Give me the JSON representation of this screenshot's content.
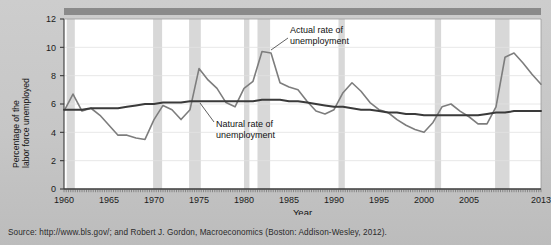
{
  "figure": {
    "source_note": "Source: http://www.bls.gov/; and Robert J. Gordon, Macroeconomics (Boston: Addison-Wesley, 2012)."
  },
  "axes": {
    "ylabel_line1": "Percentage of the",
    "ylabel_line2": "labor force unemployed",
    "xlabel": "Year",
    "yticks": [
      "0",
      "2",
      "4",
      "6",
      "8",
      "10",
      "12"
    ],
    "xticks": [
      "1960",
      "1965",
      "1970",
      "1975",
      "1980",
      "1985",
      "1990",
      "1995",
      "2000",
      "2005",
      "2013"
    ]
  },
  "annotations": [
    {
      "name": "actual-rate-annotation",
      "line1": "Actual rate of",
      "line2": "unemployment"
    },
    {
      "name": "natural-rate-annotation",
      "line1": "Natural rate of",
      "line2": "unemployment"
    }
  ],
  "colors": {
    "actual_line": "#7d7d7d",
    "natural_line": "#3a3a3a",
    "recession_band": "#d8d8d8",
    "plot_background": "#ffffff",
    "page_background": "#c9c9c9",
    "top_bar": "#8a8a8a"
  },
  "chart_data": {
    "type": "line",
    "title": "",
    "xlabel": "Year",
    "ylabel": "Percentage of the labor force unemployed",
    "xlim": [
      1960,
      2013
    ],
    "ylim": [
      0,
      12
    ],
    "grid": true,
    "legend": "inline-annotations",
    "x": [
      1960,
      1961,
      1962,
      1963,
      1964,
      1965,
      1966,
      1967,
      1968,
      1969,
      1970,
      1971,
      1972,
      1973,
      1974,
      1975,
      1976,
      1977,
      1978,
      1979,
      1980,
      1981,
      1982,
      1983,
      1984,
      1985,
      1986,
      1987,
      1988,
      1989,
      1990,
      1991,
      1992,
      1993,
      1994,
      1995,
      1996,
      1997,
      1998,
      1999,
      2000,
      2001,
      2002,
      2003,
      2004,
      2005,
      2006,
      2007,
      2008,
      2009,
      2010,
      2011,
      2012,
      2013
    ],
    "series": [
      {
        "name": "Actual rate of unemployment",
        "color": "#7d7d7d",
        "values": [
          5.5,
          6.7,
          5.5,
          5.7,
          5.2,
          4.5,
          3.8,
          3.8,
          3.6,
          3.5,
          4.9,
          5.9,
          5.6,
          4.9,
          5.6,
          8.5,
          7.7,
          7.1,
          6.1,
          5.8,
          7.1,
          7.6,
          9.7,
          9.6,
          7.5,
          7.2,
          7.0,
          6.2,
          5.5,
          5.3,
          5.6,
          6.8,
          7.5,
          6.9,
          6.1,
          5.6,
          5.4,
          4.9,
          4.5,
          4.2,
          4.0,
          4.7,
          5.8,
          6.0,
          5.5,
          5.1,
          4.6,
          4.6,
          5.8,
          9.3,
          9.6,
          8.9,
          8.1,
          7.4
        ]
      },
      {
        "name": "Natural rate of unemployment",
        "color": "#3a3a3a",
        "values": [
          5.6,
          5.6,
          5.6,
          5.7,
          5.7,
          5.7,
          5.7,
          5.8,
          5.9,
          6.0,
          6.0,
          6.1,
          6.1,
          6.1,
          6.2,
          6.2,
          6.2,
          6.2,
          6.2,
          6.2,
          6.2,
          6.2,
          6.3,
          6.3,
          6.3,
          6.2,
          6.2,
          6.1,
          6.0,
          5.9,
          5.8,
          5.8,
          5.7,
          5.6,
          5.6,
          5.5,
          5.4,
          5.4,
          5.3,
          5.3,
          5.2,
          5.2,
          5.2,
          5.2,
          5.2,
          5.2,
          5.2,
          5.3,
          5.4,
          5.4,
          5.5,
          5.5,
          5.5,
          5.5
        ]
      }
    ],
    "recession_bands": [
      {
        "start": 1960.3,
        "end": 1961.2
      },
      {
        "start": 1969.9,
        "end": 1970.9
      },
      {
        "start": 1973.9,
        "end": 1975.2
      },
      {
        "start": 1980.0,
        "end": 1980.6
      },
      {
        "start": 1981.5,
        "end": 1982.9
      },
      {
        "start": 1990.5,
        "end": 1991.2
      },
      {
        "start": 2001.2,
        "end": 2001.9
      },
      {
        "start": 2007.9,
        "end": 2009.5
      }
    ]
  }
}
